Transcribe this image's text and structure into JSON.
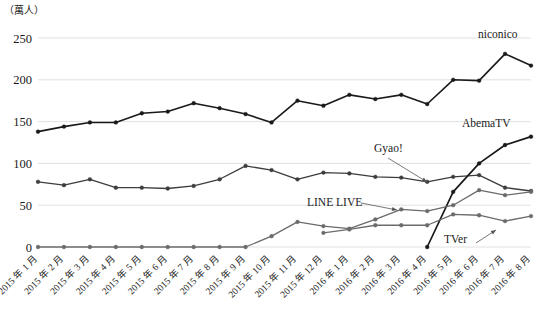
{
  "chart_data": {
    "type": "line",
    "title": "",
    "subtitle": "",
    "unit_label": "（萬人）",
    "xlabel": "",
    "ylabel": "",
    "ylim": [
      0,
      250
    ],
    "yticks": [
      0,
      50,
      100,
      150,
      200,
      250
    ],
    "ytick_labels": [
      "0",
      "50",
      "100",
      "150",
      "200",
      "250"
    ],
    "grid": true,
    "grid_axis": "y",
    "legend_position": "inline-annotations",
    "categories": [
      "2015 年 1 月",
      "2015 年 2 月",
      "2015 年 3 月",
      "2015 年 4 月",
      "2015 年 5 月",
      "2015 年 6 月",
      "2015 年 7 月",
      "2015 年 8 月",
      "2015 年 9 月",
      "2015 年 10 月",
      "2015 年 11 月",
      "2015 年 12 月",
      "2016 年 1 月",
      "2016 年 2 月",
      "2016 年 3 月",
      "2016 年 4 月",
      "2016 年 5 月",
      "2016 年 6 月",
      "2016 年 7 月",
      "2016 年 8 月"
    ],
    "series": [
      {
        "name": "niconico",
        "color": "#1a1a1a",
        "width": 1.6,
        "values": [
          138,
          144,
          149,
          149,
          160,
          162,
          172,
          166,
          159,
          149,
          175,
          169,
          182,
          177,
          182,
          171,
          200,
          199,
          231,
          217
        ]
      },
      {
        "name": "Gyao!",
        "color": "#3d3d3d",
        "width": 1.3,
        "values": [
          78,
          74,
          81,
          71,
          71,
          70,
          73,
          81,
          97,
          92,
          81,
          89,
          88,
          84,
          83,
          78,
          84,
          86,
          71,
          67
        ]
      },
      {
        "name": "AbemaTV",
        "color": "#1a1a1a",
        "width": 1.7,
        "values": [
          null,
          null,
          null,
          null,
          null,
          null,
          null,
          null,
          null,
          null,
          null,
          null,
          null,
          null,
          null,
          0,
          66,
          100,
          122,
          132
        ]
      },
      {
        "name": "LINE LIVE",
        "color": "#6b6b6b",
        "width": 1.3,
        "values": [
          0,
          0,
          0,
          0,
          0,
          0,
          0,
          0,
          0,
          13,
          30,
          25,
          22,
          33,
          45,
          43,
          50,
          68,
          62,
          66
        ]
      },
      {
        "name": "TVer",
        "color": "#6b6b6b",
        "width": 1.3,
        "values": [
          null,
          null,
          null,
          null,
          null,
          null,
          null,
          null,
          null,
          null,
          null,
          17,
          21,
          26,
          26,
          26,
          39,
          38,
          31,
          37
        ]
      }
    ],
    "annotations": [
      {
        "text": "niconico",
        "x_px": 478,
        "y_px": 38,
        "arrow": false
      },
      {
        "text": "AbemaTV",
        "x_px": 462,
        "y_px": 127,
        "arrow": false
      },
      {
        "text": "Gyao!",
        "x_px": 374,
        "y_px": 152,
        "arrow": true,
        "ax1": 388,
        "ay1": 158,
        "ax2": 427,
        "ay2": 182
      },
      {
        "text": "LINE LIVE",
        "x_px": 307,
        "y_px": 206,
        "arrow": true,
        "ax1": 361,
        "ay1": 203,
        "ax2": 397,
        "ay2": 210
      },
      {
        "text": "TVer",
        "x_px": 444,
        "y_px": 243,
        "arrow": true,
        "ax1": 476,
        "ay1": 243,
        "ax2": 496,
        "ay2": 230
      }
    ]
  }
}
